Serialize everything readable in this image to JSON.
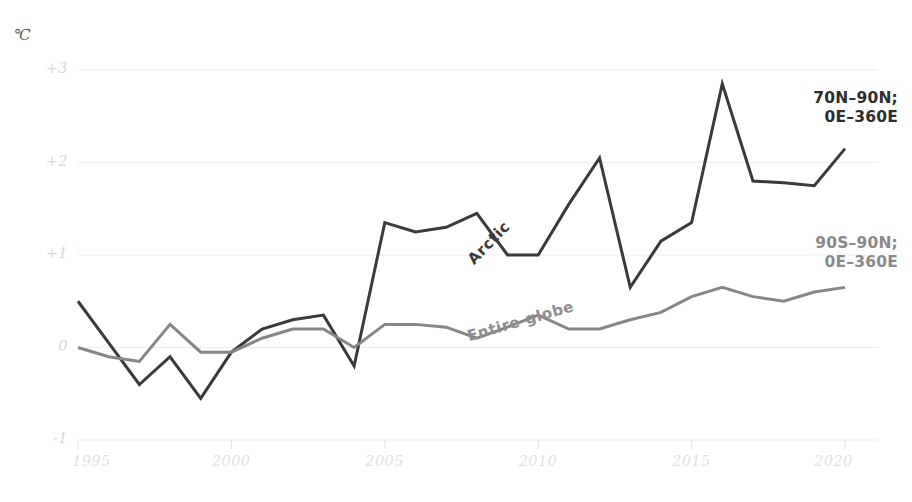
{
  "unit": "℃",
  "axes": {
    "y_ticks": [
      "+3",
      "+2",
      "+1",
      "0",
      "-1"
    ],
    "x_ticks": [
      "1995",
      "2000",
      "2005",
      "2010",
      "2015",
      "2020"
    ]
  },
  "legend": {
    "arctic_line1": "70N–90N;",
    "arctic_line2": "0E–360E",
    "globe_line1": "90S–90N;",
    "globe_line2": "0E–360E"
  },
  "series_tags": {
    "arctic": "Arctic",
    "globe": "Entire globe"
  },
  "colors": {
    "arctic": "#3a3a3a",
    "globe": "#868686",
    "grid": "#ededed",
    "tick_text": "#e0e0e0"
  },
  "chart_data": {
    "type": "line",
    "title": "",
    "xlabel": "",
    "ylabel": "℃",
    "xlim": [
      1995,
      2020
    ],
    "ylim": [
      -1,
      3
    ],
    "grid": true,
    "legend_position": "right-inline",
    "x": [
      1995,
      1996,
      1997,
      1998,
      1999,
      2000,
      2001,
      2002,
      2003,
      2004,
      2005,
      2006,
      2007,
      2008,
      2009,
      2010,
      2011,
      2012,
      2013,
      2014,
      2015,
      2016,
      2017,
      2018,
      2019,
      2020
    ],
    "series": [
      {
        "name": "Arctic",
        "label": "70N–90N; 0E–360E",
        "color": "#3a3a3a",
        "values": [
          0.5,
          0.05,
          -0.4,
          -0.1,
          -0.55,
          -0.05,
          0.2,
          0.3,
          0.35,
          -0.2,
          1.35,
          1.25,
          1.3,
          1.45,
          1.0,
          1.0,
          1.55,
          2.05,
          0.65,
          1.15,
          1.35,
          2.85,
          1.8,
          1.78,
          1.75,
          2.15
        ]
      },
      {
        "name": "Entire globe",
        "label": "90S–90N; 0E–360E",
        "color": "#868686",
        "values": [
          0.0,
          -0.1,
          -0.15,
          0.25,
          -0.05,
          -0.05,
          0.1,
          0.2,
          0.2,
          0.0,
          0.25,
          0.25,
          0.22,
          0.1,
          0.22,
          0.35,
          0.2,
          0.2,
          0.3,
          0.38,
          0.55,
          0.65,
          0.55,
          0.5,
          0.6,
          0.65
        ]
      }
    ]
  }
}
